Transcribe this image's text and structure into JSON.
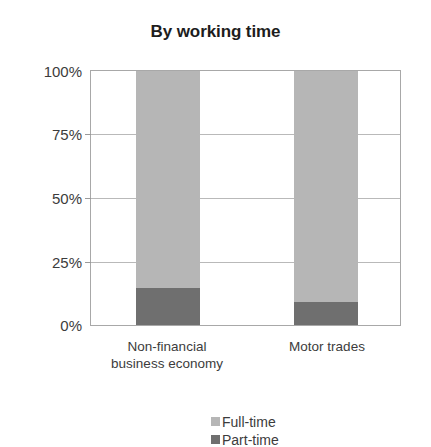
{
  "chart_data": {
    "type": "bar",
    "subtype": "stacked-percentage",
    "title": "By working time",
    "xlabel": "",
    "ylabel": "",
    "ylim": [
      0,
      100
    ],
    "yticks": [
      "0%",
      "25%",
      "50%",
      "75%",
      "100%"
    ],
    "ytick_values": [
      0,
      25,
      50,
      75,
      100
    ],
    "grid": true,
    "legend_position": "bottom",
    "categories": [
      "Non-financial business economy",
      "Motor trades"
    ],
    "category_lines": [
      [
        "Non-financial",
        "business economy"
      ],
      [
        "Motor trades"
      ]
    ],
    "series": [
      {
        "name": "Full-time",
        "values": [
          85.5,
          91.0
        ],
        "color": "#b6b6b6"
      },
      {
        "name": "Part-time",
        "values": [
          14.5,
          9.0
        ],
        "color": "#6f6f6f"
      }
    ]
  },
  "axis": {
    "y_tick_labels": [
      "100%",
      "75%",
      "50%",
      "25%",
      "0%"
    ]
  },
  "legend": {
    "items": [
      {
        "label": "Full-time"
      },
      {
        "label": "Part-time"
      }
    ]
  },
  "colors": {
    "full_time": "#b6b6b6",
    "part_time": "#6f6f6f",
    "axis": "#a8a8a8",
    "grid": "#b9b9b9",
    "text": "#3c3c3c",
    "title": "#1d1d1d",
    "background": "#ffffff"
  }
}
